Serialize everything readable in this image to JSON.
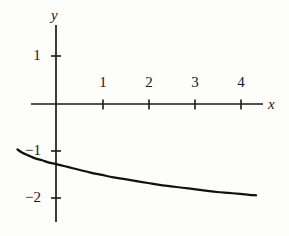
{
  "chart_data": {
    "type": "line",
    "title": "",
    "subtitle": "",
    "xlabel": "x",
    "ylabel": "y",
    "xlim": [
      -1.05,
      4.35
    ],
    "ylim": [
      -2.5,
      1.45
    ],
    "grid": false,
    "legend": null,
    "annotations": [],
    "axes": {
      "x_ticks": [
        1,
        2,
        3,
        4
      ],
      "x_tick_labels": [
        "1",
        "2",
        "3",
        "4"
      ],
      "y_ticks": [
        1,
        -1,
        -2
      ],
      "y_tick_labels": [
        "1",
        "−1",
        "−2"
      ],
      "x_axis_line": {
        "from": -0.52,
        "to": 4.31
      },
      "y_axis_line": {
        "from": -2.46,
        "to": 1.64
      },
      "arrowheads": false,
      "tick_length_px": 9
    },
    "series": [
      {
        "name": "curve",
        "color": "#111111",
        "line_width_px": 2.2,
        "x": [
          -0.84,
          -0.75,
          -0.65,
          -0.55,
          -0.45,
          -0.3,
          -0.15,
          0.0,
          0.25,
          0.5,
          0.75,
          1.0,
          1.25,
          1.5,
          1.75,
          2.0,
          2.25,
          2.5,
          2.75,
          3.0,
          3.25,
          3.5,
          3.75,
          4.0,
          4.2,
          4.35
        ],
        "y": [
          -0.96,
          -1.02,
          -1.07,
          -1.11,
          -1.15,
          -1.19,
          -1.24,
          -1.27,
          -1.33,
          -1.39,
          -1.45,
          -1.5,
          -1.55,
          -1.59,
          -1.63,
          -1.67,
          -1.71,
          -1.74,
          -1.77,
          -1.8,
          -1.83,
          -1.86,
          -1.88,
          -1.9,
          -1.92,
          -1.93
        ]
      }
    ]
  },
  "labels": {
    "y_axis_name": "y",
    "x_axis_name": "x",
    "y_tick_1": "1",
    "y_tick_neg1": "−1",
    "y_tick_neg2": "−2",
    "x_tick_1": "1",
    "x_tick_2": "2",
    "x_tick_3": "3",
    "x_tick_4": "4"
  },
  "colors": {
    "ink": "#1a1a1a",
    "curve": "#111111",
    "background": "#fdfdfb"
  }
}
